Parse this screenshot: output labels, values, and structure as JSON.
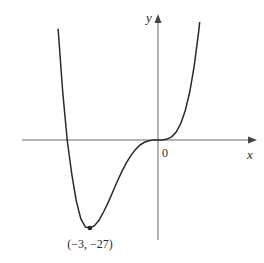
{
  "chart_data": {
    "type": "line",
    "title": "",
    "function_hint": "y = x^4 + 4x^3",
    "xlabel": "x",
    "ylabel": "y",
    "origin_label": "0",
    "grid": false,
    "legend": null,
    "xlim": [
      -6.1,
      4.2
    ],
    "ylim": [
      -30.5,
      38
    ],
    "annotations": [
      {
        "text": "(−3, −27)",
        "x": -3,
        "y": -27,
        "marker": "dot"
      }
    ],
    "series": [
      {
        "name": "f(x)",
        "points": [
          [
            -4.4,
            34.1
          ],
          [
            -4.2,
            14.8
          ],
          [
            -4.0,
            0
          ],
          [
            -3.8,
            -10.3
          ],
          [
            -3.6,
            -18.7
          ],
          [
            -3.4,
            -24.1
          ],
          [
            -3.2,
            -26.7
          ],
          [
            -3.0,
            -27
          ],
          [
            -2.8,
            -26.3
          ],
          [
            -2.6,
            -24.6
          ],
          [
            -2.4,
            -22.1
          ],
          [
            -2.2,
            -19.2
          ],
          [
            -2.0,
            -16
          ],
          [
            -1.8,
            -12.8
          ],
          [
            -1.6,
            -9.8
          ],
          [
            -1.4,
            -7.1
          ],
          [
            -1.2,
            -4.8
          ],
          [
            -1.0,
            -3
          ],
          [
            -0.8,
            -1.6
          ],
          [
            -0.6,
            -0.7
          ],
          [
            -0.4,
            -0.23
          ],
          [
            -0.2,
            -0.03
          ],
          [
            0,
            0
          ],
          [
            0.2,
            0.03
          ],
          [
            0.4,
            0.28
          ],
          [
            0.6,
            0.99
          ],
          [
            0.8,
            2.46
          ],
          [
            1.0,
            5
          ],
          [
            1.2,
            8.99
          ],
          [
            1.4,
            14.8
          ],
          [
            1.6,
            22.9
          ],
          [
            1.8,
            33.8
          ],
          [
            1.9,
            40.5
          ]
        ]
      }
    ]
  },
  "style": {
    "axis_color": "#555555",
    "curve_color": "#2a2a2a",
    "background": "#ffffff"
  }
}
